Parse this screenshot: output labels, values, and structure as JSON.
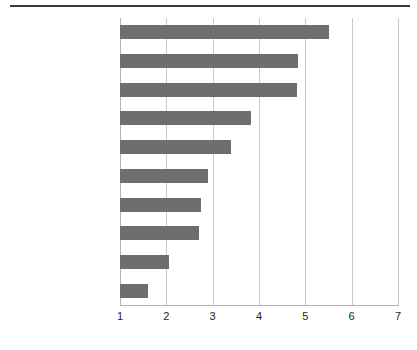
{
  "chart_data": {
    "type": "bar",
    "orientation": "horizontal",
    "title": "",
    "xlabel": "",
    "ylabel": "",
    "xlim": [
      1,
      7
    ],
    "xticks": [
      "1",
      "2",
      "3",
      "4",
      "5",
      "6",
      "7"
    ],
    "grid": true,
    "legend": null,
    "bar_color": "#6e6e6e",
    "gridline_color": "#c9c9c9",
    "baseline": 1,
    "categories": [
      "Suchmaschinen",
      "Persönlicher Kontakt\n(bspw. Vertrieb)",
      "Unternehmenswebsite",
      "Broschüren, Kataloge,\nHandelsmagazine",
      "Events, Messen",
      "Fachzeitschriften",
      "Online-Fachpresse",
      "Rundfunk- und\nPrintwerbung",
      "Social Media,\nFachforen",
      "Pop-Ups,\nBannerwerbung"
    ],
    "values": [
      5.5,
      4.85,
      4.83,
      3.83,
      3.4,
      2.9,
      2.75,
      2.7,
      2.05,
      1.6
    ]
  },
  "caption": {
    "sliver_text": ""
  }
}
